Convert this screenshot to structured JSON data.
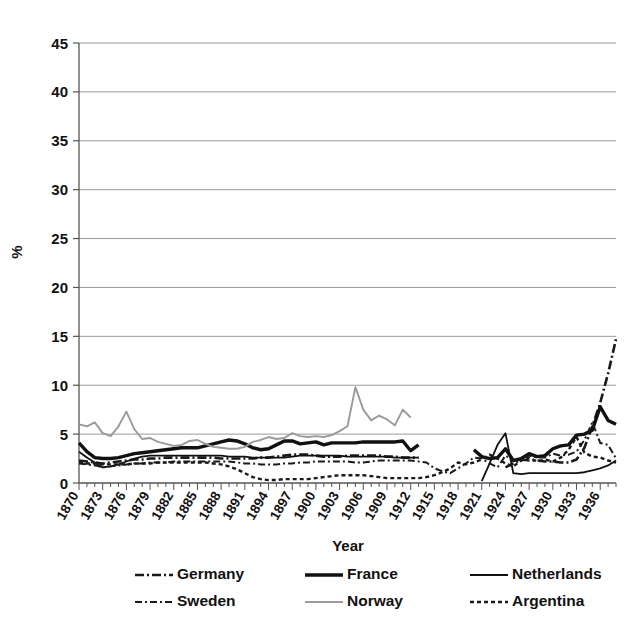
{
  "chart_data": {
    "type": "line",
    "title": "",
    "xlabel": "Year",
    "ylabel": "%",
    "xlim": [
      1870,
      1938
    ],
    "ylim": [
      0,
      45
    ],
    "ytick_values": [
      0,
      5,
      10,
      15,
      20,
      25,
      30,
      35,
      40,
      45
    ],
    "xtick_labels": [
      "1870",
      "1873",
      "1876",
      "1879",
      "1882",
      "1885",
      "1888",
      "1891",
      "1894",
      "1897",
      "1900",
      "1903",
      "1906",
      "1909",
      "1912",
      "1915",
      "1918",
      "1921",
      "1924",
      "1927",
      "1930",
      "1933",
      "1936"
    ],
    "xtick_step": 3,
    "minor_tick_step": 1,
    "grid": "horizontal",
    "legend_position": "bottom",
    "legend_columns": 3,
    "series": [
      {
        "name": "Germany",
        "style": "solid-thick-tick",
        "color": "#1a1a1a",
        "width": 2.6,
        "dash": "9,3,2,3",
        "x": [
          1870,
          1871,
          1872,
          1873,
          1874,
          1875,
          1876,
          1877,
          1878,
          1879,
          1880,
          1881,
          1882,
          1883,
          1884,
          1885,
          1886,
          1887,
          1888,
          1889,
          1890,
          1891,
          1892,
          1893,
          1894,
          1895,
          1896,
          1897,
          1898,
          1899,
          1900,
          1901,
          1902,
          1903,
          1904,
          1905,
          1906,
          1907,
          1908,
          1909,
          1910,
          1911,
          1912,
          1913,
          1924,
          1925,
          1926,
          1927,
          1928,
          1929,
          1930,
          1931,
          1932,
          1933,
          1934,
          1935,
          1936,
          1937,
          1938
        ],
        "y": [
          2.3,
          2.2,
          2.1,
          2.0,
          2.1,
          2.2,
          2.3,
          2.4,
          2.4,
          2.5,
          2.5,
          2.6,
          2.6,
          2.6,
          2.6,
          2.6,
          2.6,
          2.6,
          2.5,
          2.5,
          2.5,
          2.5,
          2.5,
          2.6,
          2.6,
          2.7,
          2.8,
          2.9,
          2.9,
          2.9,
          2.8,
          2.7,
          2.7,
          2.7,
          2.8,
          2.8,
          2.8,
          2.8,
          2.8,
          2.7,
          2.7,
          2.6,
          2.6,
          2.6,
          1.6,
          2.0,
          2.4,
          2.3,
          2.3,
          2.2,
          2.2,
          2.1,
          2.1,
          2.4,
          3.6,
          5.8,
          8.2,
          11.2,
          14.7
        ]
      },
      {
        "name": "France",
        "style": "solid-thick",
        "color": "#111111",
        "width": 3.4,
        "dash": "",
        "x": [
          1870,
          1871,
          1872,
          1873,
          1874,
          1875,
          1876,
          1877,
          1878,
          1879,
          1880,
          1881,
          1882,
          1883,
          1884,
          1885,
          1886,
          1887,
          1888,
          1889,
          1890,
          1891,
          1892,
          1893,
          1894,
          1895,
          1896,
          1897,
          1898,
          1899,
          1900,
          1901,
          1902,
          1903,
          1904,
          1905,
          1906,
          1907,
          1908,
          1909,
          1910,
          1911,
          1912,
          1913,
          1920,
          1921,
          1922,
          1923,
          1924,
          1925,
          1926,
          1927,
          1928,
          1929,
          1930,
          1931,
          1932,
          1933,
          1934,
          1935,
          1936,
          1937,
          1938
        ],
        "y": [
          4.1,
          3.2,
          2.6,
          2.5,
          2.5,
          2.6,
          2.8,
          3.0,
          3.1,
          3.2,
          3.3,
          3.4,
          3.5,
          3.6,
          3.6,
          3.6,
          3.8,
          4.0,
          4.2,
          4.4,
          4.3,
          4.0,
          3.6,
          3.4,
          3.5,
          3.9,
          4.3,
          4.3,
          4.0,
          4.1,
          4.2,
          3.9,
          4.1,
          4.1,
          4.1,
          4.1,
          4.2,
          4.2,
          4.2,
          4.2,
          4.2,
          4.3,
          3.3,
          3.9,
          3.4,
          2.7,
          2.5,
          2.6,
          3.5,
          2.3,
          2.5,
          3.0,
          2.7,
          2.8,
          3.5,
          3.8,
          3.9,
          4.9,
          5.0,
          5.4,
          7.8,
          6.4,
          6.0
        ]
      },
      {
        "name": "Netherlands",
        "style": "solid-thin",
        "color": "#111111",
        "width": 1.8,
        "dash": "",
        "x": [
          1870,
          1871,
          1872,
          1873,
          1874,
          1875,
          1876,
          1877,
          1878,
          1879,
          1880,
          1881,
          1882,
          1883,
          1884,
          1885,
          1886,
          1887,
          1888,
          1889,
          1890,
          1891,
          1892,
          1893,
          1894,
          1895,
          1896,
          1897,
          1898,
          1899,
          1900,
          1901,
          1902,
          1903,
          1904,
          1905,
          1906,
          1907,
          1908,
          1909,
          1910,
          1911,
          1912,
          1913,
          1921,
          1922,
          1923,
          1924,
          1925,
          1926,
          1927,
          1928,
          1929,
          1930,
          1931,
          1932,
          1933,
          1934,
          1935,
          1936,
          1937,
          1938
        ],
        "y": [
          3.2,
          2.6,
          2.1,
          1.6,
          1.7,
          1.9,
          2.2,
          2.5,
          2.7,
          2.8,
          2.8,
          2.8,
          2.8,
          2.8,
          2.8,
          2.8,
          2.8,
          2.8,
          2.8,
          2.7,
          2.7,
          2.7,
          2.6,
          2.6,
          2.6,
          2.6,
          2.6,
          2.7,
          2.8,
          2.8,
          2.8,
          2.8,
          2.8,
          2.8,
          2.7,
          2.7,
          2.7,
          2.7,
          2.7,
          2.7,
          2.6,
          2.6,
          2.6,
          2.6,
          0.2,
          2.0,
          3.9,
          5.1,
          1.0,
          0.9,
          1.0,
          1.0,
          1.0,
          1.0,
          1.0,
          1.0,
          1.0,
          1.1,
          1.3,
          1.5,
          1.8,
          2.3
        ]
      },
      {
        "name": "Sweden",
        "style": "dash-dot",
        "color": "#1a1a1a",
        "width": 2.0,
        "dash": "7,3,2,3",
        "x": [
          1870,
          1871,
          1872,
          1873,
          1874,
          1875,
          1876,
          1877,
          1878,
          1879,
          1880,
          1881,
          1882,
          1883,
          1884,
          1885,
          1886,
          1887,
          1888,
          1889,
          1890,
          1891,
          1892,
          1893,
          1894,
          1895,
          1896,
          1897,
          1898,
          1899,
          1900,
          1901,
          1902,
          1903,
          1904,
          1905,
          1906,
          1907,
          1908,
          1909,
          1910,
          1911,
          1912,
          1913,
          1914,
          1915,
          1916,
          1917,
          1918,
          1919,
          1920,
          1921,
          1922,
          1923,
          1924,
          1925,
          1926,
          1927,
          1928,
          1929,
          1930,
          1931,
          1932,
          1933,
          1934,
          1935,
          1936,
          1937,
          1938
        ],
        "y": [
          2.0,
          1.9,
          1.8,
          1.6,
          1.7,
          1.8,
          1.9,
          2.0,
          2.0,
          2.1,
          2.1,
          2.1,
          2.2,
          2.2,
          2.2,
          2.2,
          2.2,
          2.2,
          2.2,
          2.2,
          2.1,
          2.0,
          2.0,
          1.9,
          1.9,
          1.9,
          2.0,
          2.0,
          2.1,
          2.1,
          2.2,
          2.2,
          2.2,
          2.2,
          2.2,
          2.1,
          2.1,
          2.2,
          2.3,
          2.3,
          2.3,
          2.3,
          2.3,
          2.2,
          2.1,
          1.5,
          1.2,
          1.0,
          1.5,
          2.0,
          2.6,
          2.5,
          2.0,
          1.6,
          2.8,
          2.3,
          2.5,
          2.8,
          2.6,
          2.6,
          3.0,
          2.8,
          2.9,
          3.2,
          4.4,
          6.2,
          4.1,
          3.9,
          2.5
        ]
      },
      {
        "name": "Norway",
        "style": "solid-light",
        "color": "#9a9a9a",
        "width": 1.9,
        "dash": "",
        "x": [
          1870,
          1871,
          1872,
          1873,
          1874,
          1875,
          1876,
          1877,
          1878,
          1879,
          1880,
          1881,
          1882,
          1883,
          1884,
          1885,
          1886,
          1887,
          1888,
          1889,
          1890,
          1891,
          1892,
          1893,
          1894,
          1895,
          1896,
          1897,
          1898,
          1899,
          1900,
          1901,
          1902,
          1903,
          1904,
          1905,
          1906,
          1907,
          1908,
          1909,
          1910,
          1911,
          1912
        ],
        "y": [
          6.0,
          5.8,
          6.2,
          5.1,
          4.8,
          5.8,
          7.3,
          5.5,
          4.5,
          4.6,
          4.2,
          4.0,
          3.8,
          3.9,
          4.3,
          4.4,
          4.0,
          3.7,
          3.6,
          3.5,
          3.5,
          3.7,
          4.2,
          4.4,
          4.7,
          4.5,
          4.6,
          5.1,
          4.8,
          4.7,
          4.8,
          4.7,
          4.9,
          5.3,
          5.8,
          9.8,
          7.5,
          6.4,
          6.9,
          6.5,
          5.9,
          7.5,
          6.7
        ]
      },
      {
        "name": "Argentina",
        "style": "dotted",
        "color": "#1a1a1a",
        "width": 2.4,
        "dash": "4,3",
        "x": [
          1870,
          1871,
          1872,
          1873,
          1874,
          1875,
          1876,
          1877,
          1878,
          1879,
          1880,
          1881,
          1882,
          1883,
          1884,
          1885,
          1886,
          1887,
          1888,
          1889,
          1890,
          1891,
          1892,
          1893,
          1894,
          1895,
          1896,
          1897,
          1898,
          1899,
          1900,
          1901,
          1902,
          1903,
          1904,
          1905,
          1906,
          1907,
          1908,
          1909,
          1910,
          1911,
          1912,
          1913,
          1914,
          1915,
          1916,
          1917,
          1918,
          1919,
          1920,
          1921,
          1922,
          1923,
          1924,
          1925,
          1926,
          1927,
          1928,
          1929,
          1930,
          1931,
          1932,
          1933,
          1934,
          1935,
          1936,
          1937,
          1938
        ],
        "y": [
          2.1,
          2.0,
          2.0,
          1.9,
          1.9,
          1.9,
          1.9,
          2.0,
          2.0,
          2.0,
          2.1,
          2.1,
          2.1,
          2.1,
          2.1,
          2.1,
          2.1,
          2.0,
          1.9,
          1.7,
          1.4,
          1.0,
          0.6,
          0.4,
          0.3,
          0.3,
          0.4,
          0.4,
          0.4,
          0.4,
          0.5,
          0.6,
          0.7,
          0.8,
          0.8,
          0.8,
          0.8,
          0.7,
          0.6,
          0.5,
          0.5,
          0.5,
          0.5,
          0.5,
          0.6,
          0.8,
          1.1,
          1.5,
          2.1,
          1.9,
          2.1,
          2.4,
          2.9,
          2.5,
          2.0,
          1.7,
          2.3,
          2.6,
          2.2,
          2.4,
          2.2,
          2.6,
          3.4,
          4.7,
          3.1,
          2.7,
          2.6,
          2.3,
          2.1
        ]
      }
    ]
  },
  "legend": {
    "items": [
      {
        "label": "Germany"
      },
      {
        "label": "France"
      },
      {
        "label": "Netherlands"
      },
      {
        "label": "Sweden"
      },
      {
        "label": "Norway"
      },
      {
        "label": "Argentina"
      }
    ]
  },
  "colors": {
    "grid": "#9a9a9a",
    "axis": "#555555",
    "text": "#111111",
    "light_series": "#9a9a9a",
    "dark_series": "#111111",
    "background": "#ffffff"
  }
}
